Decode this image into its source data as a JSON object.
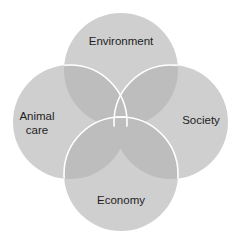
{
  "diagram": {
    "type": "four-circle-venn",
    "circles": [
      {
        "id": "environment",
        "label_lines": [
          "Environment"
        ],
        "cx": 121,
        "cy": 70,
        "r": 57
      },
      {
        "id": "animal-care",
        "label_lines": [
          "Animal",
          "care"
        ],
        "cx": 70,
        "cy": 122,
        "r": 57
      },
      {
        "id": "society",
        "label_lines": [
          "Society"
        ],
        "cx": 171,
        "cy": 122,
        "r": 57
      },
      {
        "id": "economy",
        "label_lines": [
          "Economy"
        ],
        "cx": 121,
        "cy": 174,
        "r": 57
      }
    ],
    "colors": {
      "fill": "#cfcfcf",
      "overlap_tint": "#a9a9a9",
      "stroke": "#ffffff",
      "text": "#1e1e1e",
      "background": "#ffffff"
    }
  }
}
